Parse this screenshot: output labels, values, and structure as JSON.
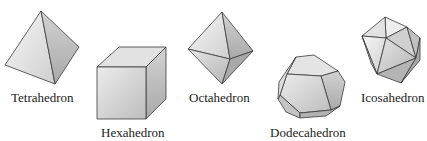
{
  "figure": {
    "solids": [
      {
        "id": "tetrahedron",
        "label": "Tetrahedron"
      },
      {
        "id": "hexahedron",
        "label": "Hexahedron"
      },
      {
        "id": "octahedron",
        "label": "Octahedron"
      },
      {
        "id": "dodecahedron",
        "label": "Dodecahedron"
      },
      {
        "id": "icosahedron",
        "label": "Icosahedron"
      }
    ],
    "colors": {
      "edge": "#3a3a3a",
      "face_light": "#f2f2f2",
      "face_mid": "#d9d9d9",
      "face_dark": "#b8b8b8",
      "background": "#ffffff"
    }
  }
}
